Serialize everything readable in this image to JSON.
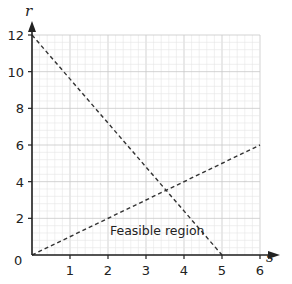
{
  "chart_data": {
    "type": "line",
    "title": "",
    "xlabel": "s",
    "ylabel": "r",
    "xlim": [
      0,
      6
    ],
    "ylim": [
      0,
      12
    ],
    "x_ticks": [
      1,
      2,
      3,
      4,
      5,
      6
    ],
    "y_ticks": [
      2,
      4,
      6,
      8,
      10,
      12
    ],
    "origin_label": "0",
    "grid": true,
    "series": [
      {
        "name": "line 1 (r = 12 - 2.4s)",
        "style": "dashed",
        "points": [
          [
            0,
            12
          ],
          [
            5,
            0
          ]
        ]
      },
      {
        "name": "line 2 (r = s)",
        "style": "dashed",
        "points": [
          [
            0,
            0
          ],
          [
            6,
            6
          ]
        ]
      }
    ],
    "annotations": [
      {
        "text": "Feasible region",
        "x": 3.1,
        "y": 1.3
      }
    ]
  },
  "labels": {
    "x_axis": "s",
    "y_axis": "r",
    "origin": "0",
    "region": "Feasible region",
    "x_ticks": [
      "1",
      "2",
      "3",
      "4",
      "5",
      "6"
    ],
    "y_ticks": [
      "2",
      "4",
      "6",
      "8",
      "10",
      "12"
    ]
  },
  "colors": {
    "axis": "#222222",
    "grid_major": "#c8c8c8",
    "grid_minor": "#e6e6e6",
    "line": "#333333"
  }
}
